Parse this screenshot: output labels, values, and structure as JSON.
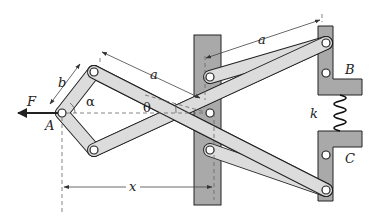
{
  "diagram": {
    "type": "scissor-linkage mechanism",
    "colors": {
      "link_fill": "#dcdcdc",
      "support_fill": "#a9a9a9",
      "outline": "#222222",
      "dim_line": "#444444"
    },
    "labels": {
      "force": "F",
      "point_a": "A",
      "point_b": "B",
      "point_c": "C",
      "spring": "k",
      "link_long": "a",
      "link_long_top": "a",
      "link_short": "b",
      "distance": "x",
      "angle_alpha": "α",
      "angle_theta": "θ"
    }
  }
}
